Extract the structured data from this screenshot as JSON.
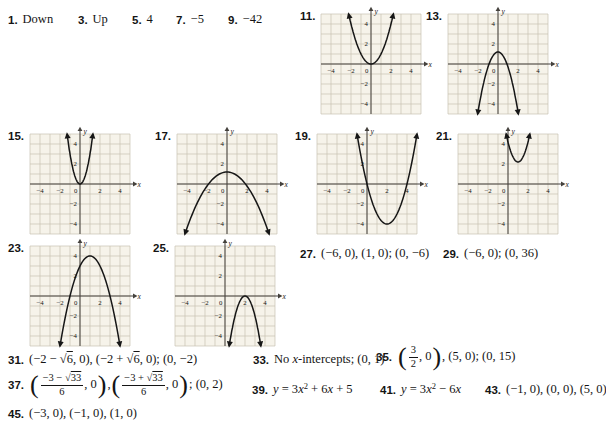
{
  "colors": {
    "page_bg": "#ffffff",
    "graph_bg": "#f6f3ea",
    "grid": "#c7c1b3",
    "axis": "#44413c",
    "curve": "#161616",
    "text": "#141414"
  },
  "graph_style": {
    "xlabel": "x",
    "ylabel": "y",
    "xticks": [
      -4,
      -2,
      2,
      4
    ],
    "yticks": [
      4,
      2,
      -2,
      -4
    ],
    "origin_label": "0",
    "xrange": [
      -5,
      5
    ],
    "yrange": [
      -5,
      5
    ],
    "grid": true
  },
  "graphs": [
    {
      "id": "11",
      "label": "11.",
      "type": "parabola",
      "vertex": [
        0,
        0
      ],
      "a": 1,
      "opens": "up",
      "pos": [
        300,
        6
      ]
    },
    {
      "id": "13",
      "label": "13.",
      "type": "parabola",
      "vertex": [
        0,
        1.2
      ],
      "a": -1.5,
      "opens": "down",
      "pos": [
        426,
        6
      ]
    },
    {
      "id": "15",
      "label": "15.",
      "type": "parabola",
      "vertex": [
        0,
        0
      ],
      "a": 3,
      "opens": "up",
      "pos": [
        8,
        126
      ]
    },
    {
      "id": "17",
      "label": "17.",
      "type": "parabola",
      "vertex": [
        0,
        1.2
      ],
      "a": -0.35,
      "opens": "down",
      "pos": [
        155,
        126
      ]
    },
    {
      "id": "19",
      "label": "19.",
      "type": "parabola",
      "vertex": [
        2,
        -4
      ],
      "a": 1,
      "opens": "up",
      "pos": [
        295,
        126
      ]
    },
    {
      "id": "21",
      "label": "21.",
      "type": "parabola",
      "vertex": [
        1,
        2.2
      ],
      "a": 2,
      "opens": "up",
      "pos": [
        436,
        126
      ]
    },
    {
      "id": "23",
      "label": "23.",
      "type": "parabola",
      "vertex": [
        1,
        4
      ],
      "a": -1,
      "opens": "down",
      "pos": [
        8,
        238
      ]
    },
    {
      "id": "25",
      "label": "25.",
      "type": "parabola",
      "vertex": [
        2,
        0
      ],
      "a": -2,
      "opens": "down",
      "pos": [
        153,
        238
      ]
    }
  ],
  "answers": [
    {
      "num": "1.",
      "pos": [
        8,
        12
      ],
      "parts": [
        {
          "t": "text",
          "v": "Down"
        }
      ]
    },
    {
      "num": "3.",
      "pos": [
        78,
        12
      ],
      "parts": [
        {
          "t": "text",
          "v": "Up"
        }
      ]
    },
    {
      "num": "5.",
      "pos": [
        132,
        12
      ],
      "parts": [
        {
          "t": "text",
          "v": "4"
        }
      ]
    },
    {
      "num": "7.",
      "pos": [
        176,
        12
      ],
      "parts": [
        {
          "t": "text",
          "v": "−5"
        }
      ]
    },
    {
      "num": "9.",
      "pos": [
        228,
        12
      ],
      "parts": [
        {
          "t": "text",
          "v": "−42"
        }
      ]
    },
    {
      "num": "27.",
      "pos": [
        300,
        246
      ],
      "parts": [
        {
          "t": "text",
          "v": "(−6, 0), (1, 0); (0, −6)"
        }
      ]
    },
    {
      "num": "29.",
      "pos": [
        443,
        246
      ],
      "parts": [
        {
          "t": "text",
          "v": "(−6, 0); (0, 36)"
        }
      ]
    },
    {
      "num": "31.",
      "pos": [
        8,
        352
      ],
      "parts": [
        {
          "t": "text",
          "v": "(−2 − √6, 0), (−2 + √6, 0); (0, −2)"
        }
      ]
    },
    {
      "num": "33.",
      "pos": [
        253,
        352
      ],
      "parts": [
        {
          "t": "text",
          "v": "No "
        },
        {
          "t": "it",
          "v": "x"
        },
        {
          "t": "text",
          "v": "-intercepts; (0, 1)"
        }
      ]
    },
    {
      "num": "35.",
      "pos": [
        376,
        344
      ],
      "parts": [
        {
          "t": "bigo"
        },
        {
          "t": "frac",
          "num": "3",
          "den": "2"
        },
        {
          "t": "text",
          "v": ", 0"
        },
        {
          "t": "bigc"
        },
        {
          "t": "text",
          "v": ", (5, 0); (0, 15)"
        }
      ]
    },
    {
      "num": "37.",
      "pos": [
        8,
        372
      ],
      "parts": [
        {
          "t": "bigo"
        },
        {
          "t": "frac",
          "num": "−3 − √33",
          "den": "6"
        },
        {
          "t": "text",
          "v": ", 0"
        },
        {
          "t": "bigc"
        },
        {
          "t": "text",
          "v": ","
        },
        {
          "t": "bigo"
        },
        {
          "t": "frac",
          "num": "−3 + √33",
          "den": "6"
        },
        {
          "t": "text",
          "v": ", 0"
        },
        {
          "t": "bigc"
        },
        {
          "t": "text",
          "v": "; (0, 2)"
        }
      ]
    },
    {
      "num": "39.",
      "pos": [
        252,
        382
      ],
      "parts": [
        {
          "t": "it",
          "v": "y"
        },
        {
          "t": "text",
          "v": " = 3"
        },
        {
          "t": "it",
          "v": "x"
        },
        {
          "t": "sup",
          "v": "2"
        },
        {
          "t": "text",
          "v": " + 6"
        },
        {
          "t": "it",
          "v": "x"
        },
        {
          "t": "text",
          "v": " + 5"
        }
      ]
    },
    {
      "num": "41.",
      "pos": [
        380,
        382
      ],
      "parts": [
        {
          "t": "it",
          "v": "y"
        },
        {
          "t": "text",
          "v": " = 3"
        },
        {
          "t": "it",
          "v": "x"
        },
        {
          "t": "sup",
          "v": "2"
        },
        {
          "t": "text",
          "v": " − 6"
        },
        {
          "t": "it",
          "v": "x"
        }
      ]
    },
    {
      "num": "43.",
      "pos": [
        485,
        382
      ],
      "parts": [
        {
          "t": "text",
          "v": "(−1, 0), (0, 0), (5, 0)"
        }
      ]
    },
    {
      "num": "45.",
      "pos": [
        8,
        406
      ],
      "parts": [
        {
          "t": "text",
          "v": "(−3, 0), (−1, 0), (1, 0)"
        }
      ]
    }
  ]
}
